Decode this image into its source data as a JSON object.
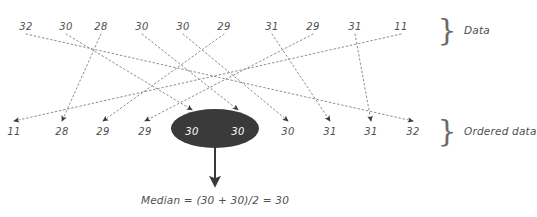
{
  "diagram": {
    "title_text": "Median = (30 + 30)/2 = 30",
    "colors": {
      "background": "#ffffff",
      "text": "#4f4f4f",
      "ellipse_fill": "#3a3a3a",
      "ellipse_text": "#ffffff",
      "dotted_line": "#8c8c8c",
      "arrow": "#3a3a3a"
    },
    "labels": {
      "data_brace": "Data",
      "ordered_brace": "Ordered data",
      "brace_glyph": "}"
    },
    "data_row": {
      "label": "Data",
      "values": [
        "32",
        "30",
        "28",
        "30",
        "30",
        "29",
        "31",
        "29",
        "31",
        "11"
      ],
      "x": [
        26,
        66,
        101,
        142,
        183,
        224,
        272,
        313,
        355,
        401
      ],
      "y": 26
    },
    "ordered_row": {
      "label": "Ordered data",
      "values": [
        "11",
        "28",
        "29",
        "29",
        "30",
        "30",
        "30",
        "31",
        "31",
        "32"
      ],
      "x": [
        14,
        62,
        103,
        145,
        192,
        238,
        288,
        330,
        371,
        413
      ],
      "y": 131
    },
    "median_ellipse": {
      "cx": 215,
      "cy": 128.5,
      "rx": 44,
      "ry": 19.5,
      "contained_values": [
        "30",
        "30"
      ]
    },
    "mapping": [
      {
        "from": 0,
        "to": 9
      },
      {
        "from": 1,
        "to": 4
      },
      {
        "from": 2,
        "to": 1
      },
      {
        "from": 3,
        "to": 5
      },
      {
        "from": 4,
        "to": 6
      },
      {
        "from": 5,
        "to": 2
      },
      {
        "from": 6,
        "to": 7
      },
      {
        "from": 7,
        "to": 3
      },
      {
        "from": 8,
        "to": 8
      },
      {
        "from": 9,
        "to": 0
      }
    ]
  }
}
